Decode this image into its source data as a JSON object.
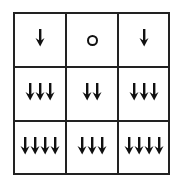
{
  "diagram": {
    "rows": 3,
    "cols": 3,
    "cells": [
      [
        {
          "type": "arrows",
          "count": 1
        },
        {
          "type": "circle",
          "count": 0
        },
        {
          "type": "arrows",
          "count": 1
        }
      ],
      [
        {
          "type": "arrows",
          "count": 3
        },
        {
          "type": "arrows",
          "count": 2
        },
        {
          "type": "arrows",
          "count": 3
        }
      ],
      [
        {
          "type": "arrows",
          "count": 4
        },
        {
          "type": "arrows",
          "count": 3
        },
        {
          "type": "arrows",
          "count": 4
        }
      ]
    ],
    "colors": {
      "line": "#222222",
      "glyph": "#111111",
      "background": "#ffffff"
    }
  }
}
